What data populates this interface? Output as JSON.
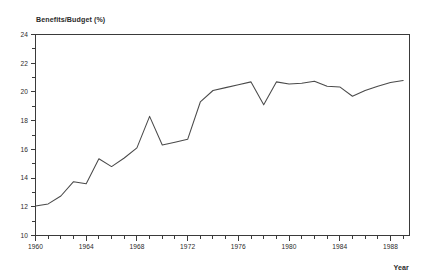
{
  "chart_data": {
    "type": "line",
    "title": "",
    "ylabel": "Benefits/Budget (%)",
    "xlabel": "Year",
    "xlim": [
      1960,
      1989.5
    ],
    "ylim": [
      10,
      24
    ],
    "grid": false,
    "legend": null,
    "y_ticks_major": [
      10,
      12,
      14,
      16,
      18,
      20,
      22,
      24
    ],
    "y_ticks_major_labels": [
      "10",
      "12",
      "14",
      "16",
      "18",
      "20",
      "22",
      "24"
    ],
    "y_ticks_minor": [
      11,
      13,
      15,
      17,
      19,
      21,
      23
    ],
    "x_ticks_major": [
      1960,
      1964,
      1968,
      1972,
      1976,
      1980,
      1984,
      1988
    ],
    "x_ticks_major_labels": [
      "1960",
      "1964",
      "1968",
      "1972",
      "1976",
      "1980",
      "1984",
      "1988"
    ],
    "x_ticks_minor": [
      1961,
      1962,
      1963,
      1965,
      1966,
      1967,
      1969,
      1970,
      1971,
      1973,
      1974,
      1975,
      1977,
      1978,
      1979,
      1981,
      1982,
      1983,
      1985,
      1986,
      1987,
      1989
    ],
    "x": [
      1960,
      1961,
      1962,
      1963,
      1964,
      1965,
      1966,
      1967,
      1968,
      1969,
      1970,
      1971,
      1972,
      1973,
      1974,
      1975,
      1976,
      1977,
      1978,
      1979,
      1980,
      1981,
      1982,
      1983,
      1984,
      1985,
      1986,
      1987,
      1988,
      1989
    ],
    "values": [
      12.05,
      12.2,
      12.75,
      13.75,
      13.6,
      15.35,
      14.8,
      15.4,
      16.1,
      18.3,
      16.3,
      16.5,
      16.7,
      19.3,
      20.1,
      20.3,
      20.5,
      20.7,
      19.1,
      20.7,
      20.55,
      20.6,
      20.75,
      20.4,
      20.35,
      19.7,
      20.1,
      20.4,
      20.65,
      20.8
    ],
    "series": [
      {
        "name": "Benefits/Budget",
        "values": [
          12.05,
          12.2,
          12.75,
          13.75,
          13.6,
          15.35,
          14.8,
          15.4,
          16.1,
          18.3,
          16.3,
          16.5,
          16.7,
          19.3,
          20.1,
          20.3,
          20.5,
          20.7,
          19.1,
          20.7,
          20.55,
          20.6,
          20.75,
          20.4,
          20.35,
          19.7,
          20.1,
          20.4,
          20.65,
          20.8
        ],
        "color": "#4a4a4a"
      }
    ]
  },
  "colors": {
    "line": "#4a4a4a",
    "axis": "#3a3a3a",
    "text": "#2b2b2b",
    "background": "#ffffff"
  }
}
